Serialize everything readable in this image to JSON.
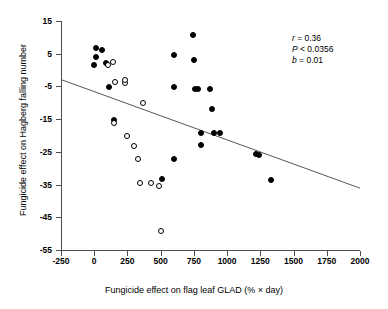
{
  "chart_data": {
    "type": "scatter",
    "title": "",
    "xlabel": "Fungicide effect on flag leaf GLAD (% × day)",
    "ylabel": "Fungicide effect on Hagberg falling number",
    "xlim": [
      -250,
      2000
    ],
    "ylim": [
      -55,
      15
    ],
    "xticks": [
      -250,
      0,
      250,
      500,
      750,
      1000,
      1250,
      1500,
      1750,
      2000
    ],
    "yticks": [
      15,
      5,
      -5,
      -15,
      -25,
      -35,
      -45,
      -55
    ],
    "xticklabels": [
      "-250",
      "0",
      "250",
      "500",
      "750",
      "1000",
      "1250",
      "1500",
      "1750",
      "2000"
    ],
    "yticklabels": [
      "15",
      "5",
      "-5",
      "-15",
      "-25",
      "-35",
      "-45",
      "-55"
    ],
    "grid": false,
    "legend": "none",
    "series": [
      {
        "name": "filled",
        "marker": "filled-circle",
        "color": "#000000",
        "points": [
          {
            "x": 10,
            "y": 6.7
          },
          {
            "x": 60,
            "y": 6.1
          },
          {
            "x": 15,
            "y": 3.9
          },
          {
            "x": 85,
            "y": 2.3
          },
          {
            "x": 0,
            "y": 1.4
          },
          {
            "x": 110,
            "y": -5.1
          },
          {
            "x": 150,
            "y": -15.2
          },
          {
            "x": 510,
            "y": -33.3
          },
          {
            "x": 600,
            "y": -27.3
          },
          {
            "x": 600,
            "y": -5.2
          },
          {
            "x": 600,
            "y": 4.7
          },
          {
            "x": 745,
            "y": 10.8
          },
          {
            "x": 750,
            "y": 3.2
          },
          {
            "x": 760,
            "y": -5.8
          },
          {
            "x": 780,
            "y": -5.9
          },
          {
            "x": 800,
            "y": -19.3
          },
          {
            "x": 800,
            "y": -22.9
          },
          {
            "x": 870,
            "y": -5.9
          },
          {
            "x": 890,
            "y": -11.9
          },
          {
            "x": 900,
            "y": -19.1
          },
          {
            "x": 950,
            "y": -19.2
          },
          {
            "x": 1215,
            "y": -25.7
          },
          {
            "x": 1240,
            "y": -26.0
          },
          {
            "x": 1330,
            "y": -33.5
          }
        ]
      },
      {
        "name": "open",
        "marker": "open-circle",
        "color": "#000000",
        "points": [
          {
            "x": 145,
            "y": 2.4
          },
          {
            "x": 100,
            "y": 1.5
          },
          {
            "x": 155,
            "y": -3.6
          },
          {
            "x": 230,
            "y": -4.1
          },
          {
            "x": 235,
            "y": -2.9
          },
          {
            "x": 370,
            "y": -10.2
          },
          {
            "x": 150,
            "y": -16.3
          },
          {
            "x": 250,
            "y": -20.0
          },
          {
            "x": 300,
            "y": -23.2
          },
          {
            "x": 330,
            "y": -27.2
          },
          {
            "x": 345,
            "y": -34.5
          },
          {
            "x": 430,
            "y": -34.6
          },
          {
            "x": 490,
            "y": -35.4
          },
          {
            "x": 505,
            "y": -49.3
          }
        ]
      }
    ],
    "trendline": {
      "x0": -250,
      "y0": -2.9,
      "x1": 2000,
      "y1": -36.1,
      "color": "#555555"
    },
    "annotations": [
      {
        "symbol": "r",
        "relation": "=",
        "value": "0.36"
      },
      {
        "symbol": "P",
        "relation": "<",
        "value": "0.0356"
      },
      {
        "symbol": "b",
        "relation": "=",
        "value": "0.01"
      }
    ]
  }
}
